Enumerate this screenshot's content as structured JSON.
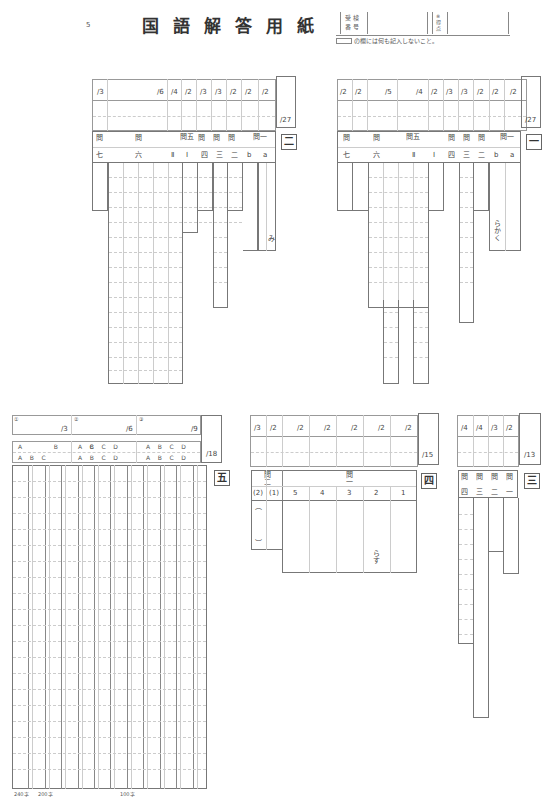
{
  "header": {
    "page_number": "5",
    "title": "国語解答用紙",
    "exam_number_label": "受検番号",
    "exam_number_label_top": "受 検",
    "exam_number_label_bottom": "番 号",
    "score_label": "得点",
    "score_label_top": "得",
    "score_label_bottom": "点",
    "score_label_pre": "※",
    "note": "の欄には何も記入しないこと。"
  },
  "section_ni": {
    "label": "二",
    "total": "/27",
    "scores": [
      "/3",
      "/6",
      "/4",
      "/2",
      "/3",
      "/3",
      "/2",
      "/2",
      "/2"
    ],
    "q_headers": [
      "問",
      "問",
      "問五",
      "問",
      "問",
      "問",
      "問一"
    ],
    "sub_headers": [
      "七",
      "六",
      "Ⅱ",
      "Ⅰ",
      "四",
      "三",
      "二",
      "b",
      "a"
    ],
    "answer_a": "み"
  },
  "section_ichi": {
    "label": "一",
    "total": "/27",
    "scores": [
      "/2",
      "/2",
      "/5",
      "/4",
      "/2",
      "/3",
      "/3",
      "/2",
      "/2",
      "/2"
    ],
    "q_headers": [
      "問",
      "問",
      "問五",
      "問",
      "問",
      "問",
      "問一"
    ],
    "sub_headers": [
      "七",
      "六",
      "Ⅱ",
      "Ⅰ",
      "四",
      "三",
      "二",
      "b",
      "a"
    ],
    "answer_a": "らかく"
  },
  "section_go": {
    "label": "五",
    "total": "/18",
    "score_cells": [
      {
        "marker": "①",
        "score": "/3"
      },
      {
        "marker": "②",
        "score": "/6"
      },
      {
        "marker": "③",
        "score": "/9"
      }
    ],
    "check_groups": [
      [
        "A",
        "B",
        "C"
      ],
      [
        "A",
        "B",
        "C",
        "D"
      ],
      [
        "A",
        "B",
        "C",
        "D"
      ]
    ],
    "char_marks": [
      "240字",
      "200字",
      "100字"
    ]
  },
  "section_yon": {
    "label": "四",
    "total": "/15",
    "scores": [
      "/3",
      "/2",
      "/2",
      "/2",
      "/2",
      "/2",
      "/2"
    ],
    "q_headers": [
      "問二",
      "問一"
    ],
    "sub_headers": [
      "(2)",
      "(1)",
      "5",
      "4",
      "3",
      "2",
      "1"
    ],
    "paren_open": "︵",
    "paren_close": "︶",
    "answer_2": "らす"
  },
  "section_san": {
    "label": "三",
    "total": "/13",
    "scores": [
      "/4",
      "/4",
      "/3",
      "/2"
    ],
    "q_headers": [
      "問",
      "問",
      "問",
      "問"
    ],
    "sub_headers": [
      "四",
      "三",
      "二",
      "一"
    ]
  }
}
